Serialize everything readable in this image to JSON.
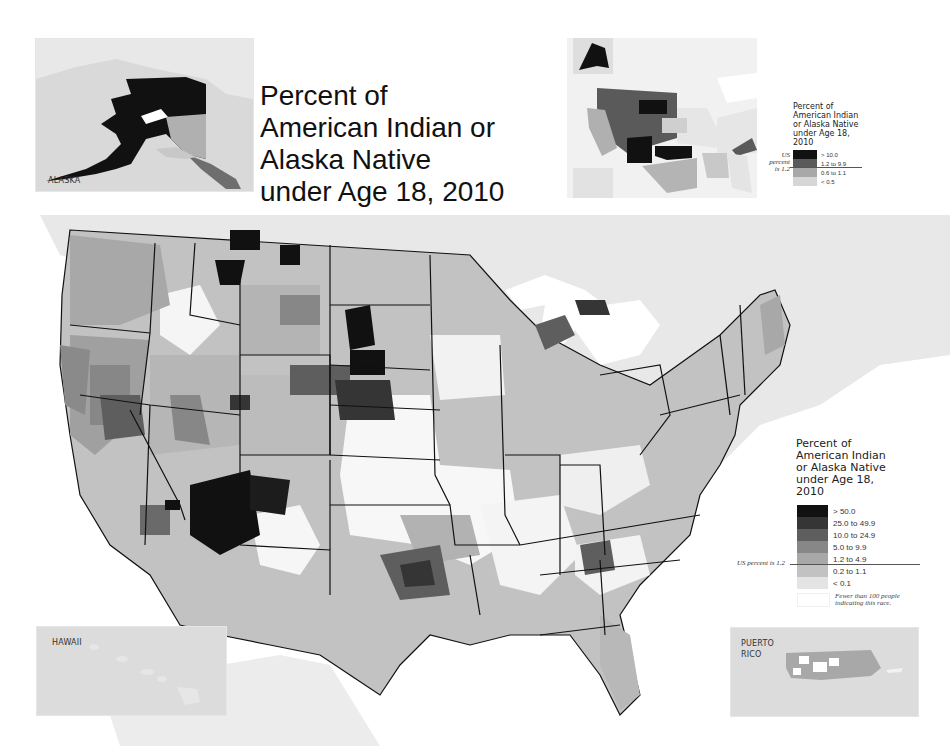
{
  "title": {
    "lines": [
      "Percent of",
      "American Indian or",
      "Alaska Native",
      "under Age 18, 2010"
    ]
  },
  "insets": {
    "alaska": {
      "label": "ALASKA"
    },
    "hawaii": {
      "label": "HAWAII"
    },
    "puerto_rico": {
      "label_lines": [
        "PUERTO",
        "RICO"
      ]
    }
  },
  "colors": {
    "water": "#dcdcdc",
    "land_bg": "#e9e9e9",
    "white": "#ffffff",
    "c_lt01": "#e4e4e4",
    "c_02_11": "#c2c2c2",
    "c_12_49": "#a8a8a8",
    "c_50_99": "#878787",
    "c_100_249": "#5e5e5e",
    "c_250_499": "#353535",
    "c_gt50": "#111111",
    "border": "#111111"
  },
  "main_legend": {
    "title_lines": [
      "Percent of",
      "American Indian",
      "or Alaska Native",
      "under Age 18,",
      "2010"
    ],
    "items": [
      {
        "label": "> 50.0",
        "color": "#111111"
      },
      {
        "label": "25.0 to 49.9",
        "color": "#353535"
      },
      {
        "label": "10.0 to 24.9",
        "color": "#5e5e5e"
      },
      {
        "label": "5.0 to 9.9",
        "color": "#878787"
      },
      {
        "label": "1.2 to 4.9",
        "color": "#a8a8a8"
      },
      {
        "label": "0.2 to 1.1",
        "color": "#c2c2c2"
      },
      {
        "label": "< 0.1",
        "color": "#e4e4e4"
      }
    ],
    "fewer_note_lines": [
      "Fewer than 100 people",
      "indicating this race."
    ],
    "us_percent": "US percent is 1.2"
  },
  "state_legend": {
    "title_lines": [
      "Percent of",
      "American Indian",
      "or Alaska Native",
      "under Age 18,",
      "2010"
    ],
    "items": [
      {
        "label": "> 10.0",
        "color": "#111111"
      },
      {
        "label": "1.2 to 9.9",
        "color": "#5a5a5a"
      },
      {
        "label": "0.6 to 1.1",
        "color": "#a8a8a8"
      },
      {
        "label": "< 0.5",
        "color": "#d6d6d6"
      }
    ],
    "us_percent_lines": [
      "US",
      "percent",
      "is 1.2"
    ]
  }
}
